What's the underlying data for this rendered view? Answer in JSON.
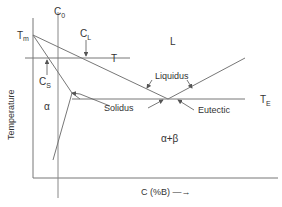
{
  "diagram": {
    "y_axis_label": "Temperature",
    "x_axis_label": "C (%B) —→",
    "labels": {
      "c0": "C",
      "c0_sub": "0",
      "tm": "T",
      "tm_sub": "m",
      "cl": "C",
      "cl_sub": "L",
      "cs": "C",
      "cs_sub": "S",
      "t": "T",
      "te": "T",
      "te_sub": "E",
      "liquid": "L",
      "alpha": "α",
      "alpha_beta": "α+β",
      "liquidus": "Liquidus",
      "solidus": "Solidus",
      "eutectic": "Eutectic"
    },
    "colors": {
      "line": "#777777",
      "text": "#333333",
      "background": "#ffffff"
    }
  }
}
